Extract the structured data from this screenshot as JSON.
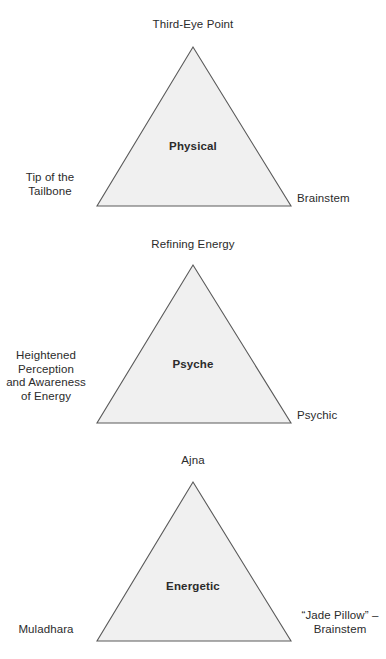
{
  "figures": [
    {
      "name": "physical",
      "apex_label": "Third-Eye Point",
      "left_label_lines": [
        "Tip of the",
        "Tailbone"
      ],
      "right_label_lines": [
        "Brainstem"
      ],
      "inner_label": "Physical"
    },
    {
      "name": "psyche",
      "apex_label": "Refining Energy",
      "left_label_lines": [
        "Heightened",
        "Perception",
        "and Awareness",
        "of Energy"
      ],
      "right_label_lines": [
        "Psychic"
      ],
      "inner_label": "Psyche"
    },
    {
      "name": "energetic",
      "apex_label": "Ajna",
      "left_label_lines": [
        "Muladhara"
      ],
      "right_label_lines": [
        "“Jade Pillow” –",
        "Brainstem"
      ],
      "inner_label": "Energetic"
    }
  ],
  "style": {
    "triangle_fill": "#f0f0f0",
    "triangle_stroke": "#5a5a5a",
    "text_color": "#2b2b2b",
    "background": "#ffffff"
  },
  "geometry": {
    "apex_x": 193,
    "base_left_x": 97,
    "base_right_x": 291,
    "triangle_height": 159
  }
}
